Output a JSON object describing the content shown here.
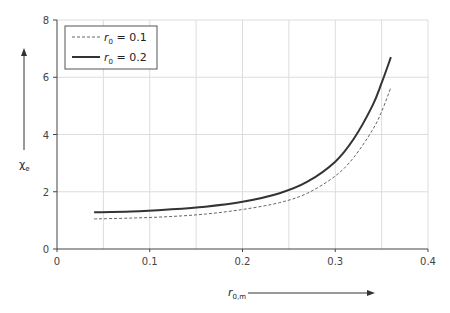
{
  "chart_data": {
    "type": "line",
    "title": "",
    "xlabel": "r_0,m",
    "ylabel": "χ_e",
    "xlim": [
      0,
      0.4
    ],
    "ylim": [
      0,
      8
    ],
    "xticks": [
      "0",
      "0.1",
      "0.2",
      "0.3",
      "0.4"
    ],
    "yticks": [
      "0",
      "2",
      "4",
      "6",
      "8"
    ],
    "grid": true,
    "legend_position": "upper-left",
    "x": [
      0.04,
      0.08,
      0.12,
      0.16,
      0.2,
      0.24,
      0.27,
      0.3,
      0.32,
      0.34,
      0.35,
      0.36
    ],
    "series": [
      {
        "name": "r_0 = 0.1",
        "style": "dashed",
        "values": [
          1.05,
          1.08,
          1.13,
          1.22,
          1.38,
          1.62,
          1.95,
          2.55,
          3.2,
          4.15,
          4.8,
          5.65
        ]
      },
      {
        "name": "r_0 = 0.2",
        "style": "solid",
        "values": [
          1.28,
          1.31,
          1.38,
          1.48,
          1.65,
          1.95,
          2.35,
          3.05,
          3.85,
          5.0,
          5.8,
          6.7
        ]
      }
    ]
  },
  "legend": {
    "items": [
      {
        "symbol": "r",
        "sub": "0",
        "text": " = 0.1"
      },
      {
        "symbol": "r",
        "sub": "0",
        "text": " = 0.2"
      }
    ]
  },
  "axes": {
    "x_label_main": "r",
    "x_label_sub": "0,m",
    "y_label_main": "χ",
    "y_label_sub": "e"
  }
}
